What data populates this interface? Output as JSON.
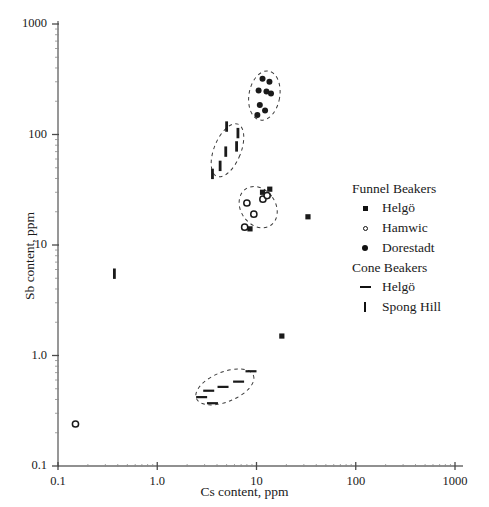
{
  "axes": {
    "xlabel": "Cs content, ppm",
    "ylabel": "Sb content, ppm",
    "xticks": [
      "0.1",
      "1.0",
      "10",
      "100",
      "1000"
    ],
    "yticks": [
      "1000",
      "100",
      "10",
      "1.0",
      "0.1"
    ]
  },
  "legend": {
    "groups": [
      {
        "title": "Funnel Beakers",
        "entries": [
          {
            "label": "Helgö",
            "marker": "filled-square"
          },
          {
            "label": "Hamwic",
            "marker": "open-circle"
          },
          {
            "label": "Dorestadt",
            "marker": "filled-circle"
          }
        ]
      },
      {
        "title": "Cone Beakers",
        "entries": [
          {
            "label": "Helgö",
            "marker": "horizontal-dash"
          },
          {
            "label": "Spong Hill",
            "marker": "vertical-bar"
          }
        ]
      }
    ]
  },
  "chart_data": {
    "type": "scatter",
    "title": "",
    "xlabel": "Cs content, ppm",
    "ylabel": "Sb content, ppm",
    "xscale": "log",
    "yscale": "log",
    "xlim": [
      0.1,
      1000
    ],
    "ylim": [
      0.1,
      1000
    ],
    "xticks": [
      0.1,
      1.0,
      10,
      100,
      1000
    ],
    "yticks": [
      0.1,
      1.0,
      10,
      100,
      1000
    ],
    "grid": false,
    "legend_position": "right",
    "series": [
      {
        "name": "Helgö",
        "group": "Funnel Beakers",
        "marker": "filled-square",
        "points": [
          [
            8.6,
            14.0
          ],
          [
            11.5,
            30.0
          ],
          [
            13.6,
            32.0
          ],
          [
            33.0,
            18.0
          ],
          [
            18.0,
            1.5
          ]
        ]
      },
      {
        "name": "Hamwic",
        "group": "Funnel Beakers",
        "marker": "open-circle",
        "points": [
          [
            8.0,
            24.0
          ],
          [
            9.4,
            19.0
          ],
          [
            11.6,
            26.0
          ],
          [
            12.8,
            28.0
          ],
          [
            7.6,
            14.5
          ],
          [
            0.15,
            0.24
          ]
        ]
      },
      {
        "name": "Dorestadt",
        "group": "Funnel Beakers",
        "marker": "filled-circle",
        "points": [
          [
            11.5,
            320.0
          ],
          [
            13.5,
            300.0
          ],
          [
            10.5,
            250.0
          ],
          [
            12.6,
            245.0
          ],
          [
            14.0,
            235.0
          ],
          [
            10.8,
            185.0
          ],
          [
            12.2,
            165.0
          ],
          [
            10.2,
            150.0
          ]
        ]
      },
      {
        "name": "Helgö",
        "group": "Cone Beakers",
        "marker": "horizontal-dash",
        "points": [
          [
            8.8,
            0.72
          ],
          [
            6.6,
            0.58
          ],
          [
            4.6,
            0.52
          ],
          [
            3.3,
            0.48
          ],
          [
            2.8,
            0.42
          ],
          [
            3.6,
            0.37
          ]
        ]
      },
      {
        "name": "Spong Hill",
        "group": "Cone Beakers",
        "marker": "vertical-bar",
        "points": [
          [
            5.0,
            118.0
          ],
          [
            6.5,
            103.0
          ],
          [
            6.3,
            78.0
          ],
          [
            4.9,
            70.0
          ],
          [
            4.3,
            52.0
          ],
          [
            3.6,
            44.0
          ],
          [
            0.37,
            5.5
          ]
        ]
      }
    ],
    "cluster_outlines": [
      {
        "name": "dorestadt-cluster",
        "cx": 12.0,
        "cy": 225.0,
        "rx_dec": 0.155,
        "ry_dec": 0.225,
        "rotation": 10
      },
      {
        "name": "spong-hill-cluster",
        "cx": 5.1,
        "cy": 72.0,
        "rx_dec": 0.135,
        "ry_dec": 0.255,
        "rotation": 22
      },
      {
        "name": "hamwic-cluster",
        "cx": 10.4,
        "cy": 22.0,
        "rx_dec": 0.175,
        "ry_dec": 0.2,
        "rotation": -35
      },
      {
        "name": "cone-helgo-cluster",
        "cx": 4.8,
        "cy": 0.52,
        "rx_dec": 0.31,
        "ry_dec": 0.135,
        "rotation": -22
      }
    ]
  }
}
